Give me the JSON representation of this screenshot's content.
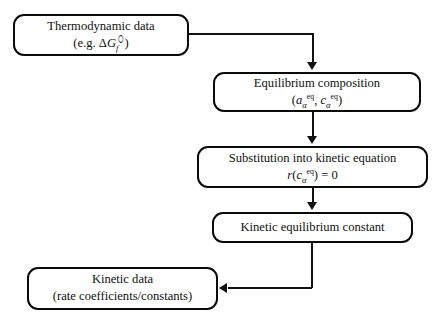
{
  "diagram": {
    "type": "flowchart",
    "orientation": "top-to-bottom",
    "colors": {
      "stroke": "#0a0a0a",
      "fill": "#ffffff",
      "text": "#111111",
      "connector": "#111111"
    },
    "nodes": [
      {
        "id": "thermodynamic-data",
        "line1": "Thermodynamic data",
        "line2_prefix": "(e.g. Δ",
        "line2_symbol": "G",
        "line2_sub": "f",
        "line2_std": "⬯",
        "line2_suffix": ")"
      },
      {
        "id": "equilibrium-composition",
        "line1": "Equilibrium composition",
        "line2_open": "(",
        "line2_a": "a",
        "line2_a_sub": "α",
        "line2_a_sup": "eq",
        "line2_comma": ", ",
        "line2_c": "c",
        "line2_c_sub": "α",
        "line2_c_sup": "eq",
        "line2_close": ")"
      },
      {
        "id": "substitution-kinetic-equation",
        "line1": "Substitution into kinetic equation",
        "line2_r": "r",
        "line2_open": "(",
        "line2_c": "c",
        "line2_c_sub": "α",
        "line2_c_sup": "eq",
        "line2_close": ")",
        "line2_eq": " = 0"
      },
      {
        "id": "kinetic-equilibrium-constant",
        "line1": "Kinetic equilibrium constant"
      },
      {
        "id": "kinetic-data",
        "line1": "Kinetic data",
        "line2": "(rate coefficients/constants)"
      }
    ],
    "edges": [
      {
        "id": "edge-thermo-to-equilibrium",
        "from": "thermodynamic-data",
        "to": "equilibrium-composition",
        "style": "elbow-right-down",
        "arrow": "down"
      },
      {
        "id": "edge-equilibrium-to-substitution",
        "from": "equilibrium-composition",
        "to": "substitution-kinetic-equation",
        "style": "straight-down",
        "arrow": "down"
      },
      {
        "id": "edge-substitution-to-constant",
        "from": "substitution-kinetic-equation",
        "to": "kinetic-equilibrium-constant",
        "style": "straight-down",
        "arrow": "down"
      },
      {
        "id": "edge-constant-to-kinetic-data",
        "from": "kinetic-equilibrium-constant",
        "to": "kinetic-data",
        "style": "elbow-down-left",
        "arrow": "left"
      }
    ]
  }
}
